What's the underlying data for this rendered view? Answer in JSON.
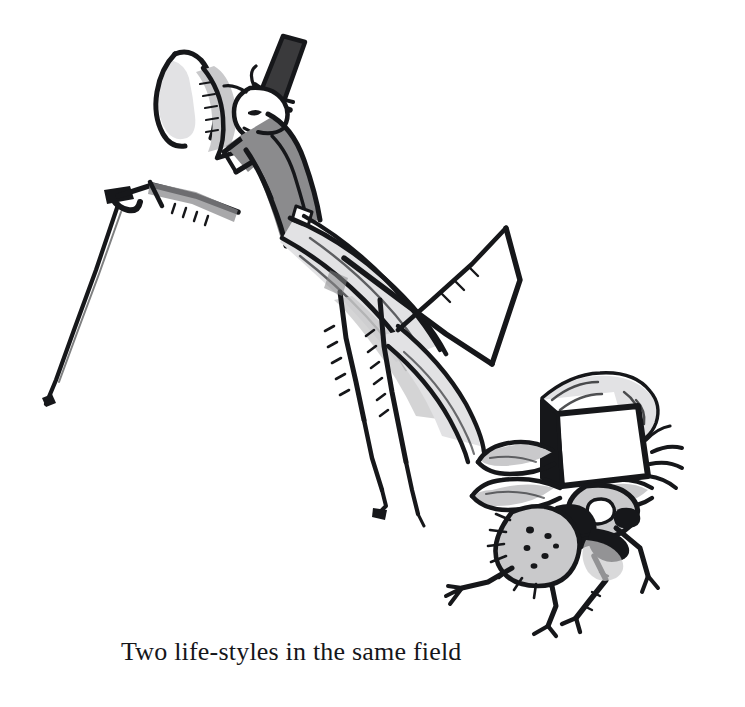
{
  "artwork": {
    "title": "Two life-styles in the same field",
    "medium": "pen-and-ink cartoon illustration",
    "background_color": "#ffffff",
    "ink_color": "#16171a",
    "palette": {
      "ink": "#16171a",
      "dark_gray": "#3a3a3c",
      "mid_gray": "#8b8b8d",
      "light_gray": "#c9c9cb",
      "pale_gray": "#e2e2e4",
      "white": "#ffffff"
    },
    "subjects": [
      {
        "name": "praying-mantis-gentleman",
        "description": "Praying mantis standing upright wearing a dark top hat and a gray jacket, tipping its raptorial foreleg in greeting while holding a slender walking cane",
        "accessories": [
          "top-hat",
          "walking-cane",
          "jacket"
        ],
        "position": "upper-left"
      },
      {
        "name": "scruffy-fly",
        "description": "Bristly spotted fly wearing a boxy blank cap with a curled brim, hairy body, compound eye and spindly legs",
        "accessories": [
          "boxy-cap"
        ],
        "position": "lower-right"
      }
    ]
  },
  "caption": {
    "text": "Two life-styles in the same field"
  }
}
